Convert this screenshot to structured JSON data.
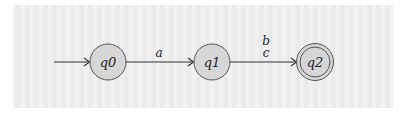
{
  "diagram": {
    "type": "finite-automaton",
    "colors": {
      "background": "#ffffff",
      "panel": "#eeeeee",
      "state_fill": "#d6d6d6",
      "state_stroke": "#555555",
      "edge": "#333333",
      "text": "#222222"
    },
    "start_state": "q0",
    "states": [
      {
        "id": "q0",
        "label": "q0",
        "accepting": false,
        "cx": 108,
        "cy": 62
      },
      {
        "id": "q1",
        "label": "q1",
        "accepting": false,
        "cx": 212,
        "cy": 62
      },
      {
        "id": "q2",
        "label": "q2",
        "accepting": true,
        "cx": 315,
        "cy": 62
      }
    ],
    "transitions": [
      {
        "from": "q0",
        "to": "q1",
        "labels": [
          "a"
        ],
        "label_text": "a"
      },
      {
        "from": "q1",
        "to": "q2",
        "labels": [
          "b",
          "c"
        ],
        "label_line1": "b",
        "label_line2": "c"
      }
    ]
  }
}
